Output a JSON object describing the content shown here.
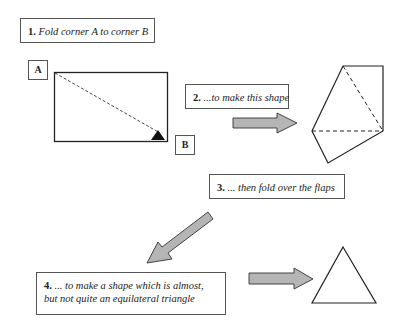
{
  "steps": [
    {
      "num": "1.",
      "text": "Fold corner A to corner B"
    },
    {
      "num": "2.",
      "text": "...to make this shape"
    },
    {
      "num": "3.",
      "text": "... then fold over the flaps"
    },
    {
      "num": "4.",
      "text_line1": "... to make a shape which is almost,",
      "text_line2": "but not quite an equilateral triangle"
    }
  ],
  "corners": {
    "a": "A",
    "b": "B"
  },
  "colors": {
    "arrow_fill": "#b5b5b5",
    "stroke": "#222222"
  }
}
